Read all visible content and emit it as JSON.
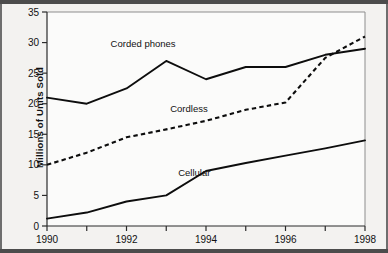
{
  "chart_data": {
    "type": "line",
    "title": "",
    "xlabel": "",
    "ylabel": "Millions of Units Sold",
    "x": [
      1990,
      1991,
      1992,
      1993,
      1994,
      1995,
      1996,
      1997,
      1998
    ],
    "xlim": [
      1990,
      1998
    ],
    "ylim": [
      0,
      35
    ],
    "ytick_labels": [
      "0",
      "5",
      "10",
      "15",
      "20",
      "25",
      "30",
      "35"
    ],
    "ytick_values": [
      0,
      5,
      10,
      15,
      20,
      25,
      30,
      35
    ],
    "xtick_values": [
      1990,
      1991,
      1992,
      1993,
      1994,
      1995,
      1996,
      1997,
      1998
    ],
    "xtick_labels": [
      "1990",
      "",
      "1992",
      "",
      "1994",
      "",
      "1996",
      "",
      "1998"
    ],
    "xtick_labeled": [
      "1990",
      "1992",
      "1994",
      "1996",
      "1998"
    ],
    "grid": false,
    "legend_position": "inline-annotations",
    "series": [
      {
        "name": "Corded phones",
        "style": "solid",
        "color": "#0d0d0d",
        "values": [
          21,
          20,
          22.5,
          27,
          24,
          26,
          26,
          28,
          29
        ],
        "label_text": "Corded phones",
        "label_x": 1991.6,
        "label_y": 29.2
      },
      {
        "name": "Cordless",
        "style": "dashed",
        "color": "#0d0d0d",
        "values": [
          10,
          12,
          14.5,
          15.8,
          17.2,
          19,
          20.2,
          27.5,
          31
        ],
        "label_text": "Cordless",
        "label_x": 1993.1,
        "label_y": 18.6
      },
      {
        "name": "Cellular",
        "style": "solid",
        "color": "#0d0d0d",
        "values": [
          1.2,
          2.2,
          4,
          5,
          9,
          10.3,
          11.5,
          12.7,
          14
        ],
        "label_text": "Cellular",
        "label_x": 1993.3,
        "label_y": 8.1
      }
    ]
  },
  "axis": {
    "y_title": "Millions of Units Sold"
  }
}
